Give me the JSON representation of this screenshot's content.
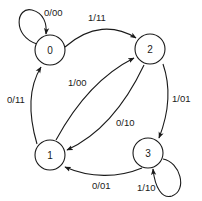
{
  "diagram": {
    "type": "finite-state-machine",
    "colors": {
      "stroke": "#1a1a1a",
      "background": "#ffffff"
    },
    "states": [
      {
        "id": "s0",
        "label": "0"
      },
      {
        "id": "s1",
        "label": "1"
      },
      {
        "id": "s2",
        "label": "2"
      },
      {
        "id": "s3",
        "label": "3"
      }
    ],
    "transitions": [
      {
        "id": "t00",
        "from": "0",
        "to": "0",
        "label": "0/00"
      },
      {
        "id": "t02",
        "from": "0",
        "to": "2",
        "label": "1/11"
      },
      {
        "id": "t23",
        "from": "2",
        "to": "3",
        "label": "1/01"
      },
      {
        "id": "t33",
        "from": "3",
        "to": "3",
        "label": "1/10"
      },
      {
        "id": "t31",
        "from": "3",
        "to": "1",
        "label": "0/01"
      },
      {
        "id": "t10",
        "from": "1",
        "to": "0",
        "label": "0/11"
      },
      {
        "id": "t12",
        "from": "1",
        "to": "2",
        "label": "1/00"
      },
      {
        "id": "t21",
        "from": "2",
        "to": "1",
        "label": "0/10"
      }
    ]
  }
}
